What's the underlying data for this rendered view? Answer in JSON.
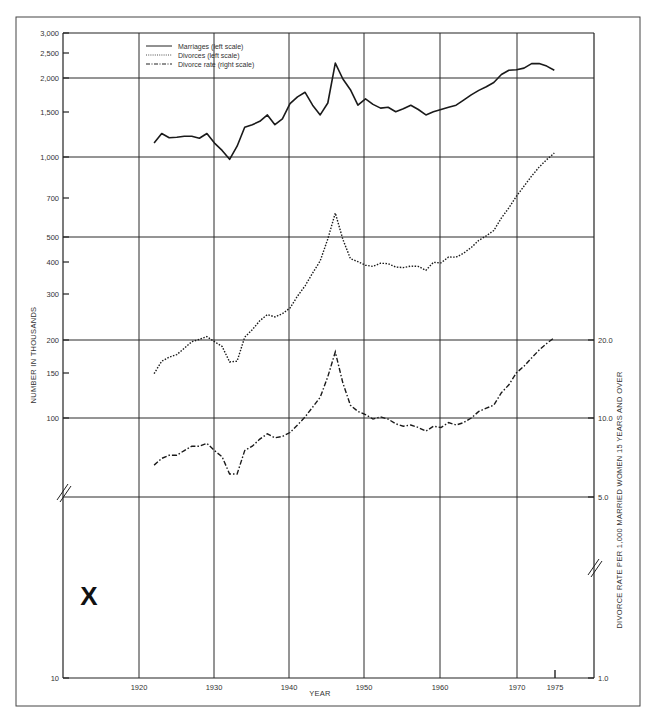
{
  "chart_data": {
    "type": "line",
    "title": "",
    "xlabel": "YEAR",
    "ylabel_left": "NUMBER IN THOUSANDS",
    "ylabel_right": "DIVORCE RATE PER 1,000 MARRIED WOMEN 15 YEARS AND OVER",
    "x_ticks": [
      "1920",
      "1930",
      "1940",
      "1950",
      "1960",
      "1970",
      "1975"
    ],
    "x_range": [
      1911,
      1980
    ],
    "y_left_scale": "log",
    "y_left_ticks": [
      "3,000",
      "2,500",
      "2,000",
      "1,500",
      "1,000",
      "700",
      "500",
      "400",
      "300",
      "200",
      "150",
      "100",
      "10"
    ],
    "y_left_range": [
      10,
      3000
    ],
    "y_right_scale": "log",
    "y_right_ticks": [
      "20.0",
      "10.0",
      "5.0",
      "1.0"
    ],
    "y_right_range": [
      1.0,
      30.0
    ],
    "axis_breaks": "both vertical axes broken between ~50 and 10 (left) / 5.0 and 1.0 (right)",
    "grid": true,
    "legend_position": "top-left inside plot",
    "legend": [
      {
        "label": "Marriages (left scale)",
        "style": "solid"
      },
      {
        "label": "Divorces (left scale)",
        "style": "dotted"
      },
      {
        "label": "Divorce rate (right scale)",
        "style": "dash-dot"
      }
    ],
    "annotations": [
      "X"
    ],
    "x": [
      1922,
      1923,
      1924,
      1925,
      1926,
      1927,
      1928,
      1929,
      1930,
      1931,
      1932,
      1933,
      1934,
      1935,
      1936,
      1937,
      1938,
      1939,
      1940,
      1941,
      1942,
      1943,
      1944,
      1945,
      1946,
      1947,
      1948,
      1949,
      1950,
      1951,
      1952,
      1953,
      1954,
      1955,
      1956,
      1957,
      1958,
      1959,
      1960,
      1961,
      1962,
      1963,
      1964,
      1965,
      1966,
      1967,
      1968,
      1969,
      1970,
      1971,
      1972,
      1973,
      1974,
      1975
    ],
    "series": [
      {
        "name": "Marriages (left scale)",
        "axis": "left",
        "unit": "thousands",
        "values": [
          1130,
          1230,
          1185,
          1190,
          1200,
          1200,
          1180,
          1230,
          1130,
          1060,
          980,
          1100,
          1300,
          1330,
          1370,
          1450,
          1330,
          1400,
          1600,
          1700,
          1770,
          1580,
          1450,
          1610,
          2290,
          1990,
          1810,
          1580,
          1670,
          1590,
          1540,
          1550,
          1490,
          1530,
          1580,
          1520,
          1450,
          1490,
          1520,
          1550,
          1580,
          1650,
          1730,
          1800,
          1860,
          1930,
          2070,
          2150,
          2160,
          2190,
          2280,
          2280,
          2230,
          2150
        ]
      },
      {
        "name": "Divorces (left scale)",
        "axis": "left",
        "unit": "thousands",
        "values": [
          148,
          165,
          171,
          175,
          185,
          196,
          200,
          205,
          196,
          188,
          164,
          165,
          204,
          218,
          236,
          249,
          244,
          251,
          264,
          293,
          321,
          359,
          400,
          485,
          610,
          483,
          408,
          397,
          385,
          381,
          392,
          390,
          379,
          377,
          382,
          381,
          368,
          395,
          393,
          414,
          413,
          428,
          450,
          479,
          499,
          523,
          584,
          639,
          708,
          773,
          845,
          915,
          977,
          1036
        ]
      },
      {
        "name": "Divorce rate (right scale)",
        "axis": "right",
        "unit": "per 1,000 married women 15+",
        "values": [
          6.6,
          7.0,
          7.2,
          7.2,
          7.5,
          7.8,
          7.8,
          8.0,
          7.5,
          7.1,
          6.1,
          6.1,
          7.5,
          7.8,
          8.3,
          8.7,
          8.4,
          8.5,
          8.8,
          9.4,
          10.1,
          11.0,
          12.0,
          14.4,
          17.9,
          13.6,
          11.2,
          10.6,
          10.3,
          9.9,
          10.1,
          9.9,
          9.5,
          9.3,
          9.4,
          9.2,
          8.9,
          9.3,
          9.2,
          9.6,
          9.4,
          9.6,
          10.0,
          10.6,
          10.9,
          11.2,
          12.5,
          13.4,
          14.9,
          15.8,
          17.0,
          18.2,
          19.3,
          20.3
        ]
      }
    ]
  },
  "labels": {
    "xlabel": "YEAR",
    "ylabel_left": "NUMBER IN THOUSANDS",
    "ylabel_right": "DIVORCE RATE PER 1,000 MARRIED WOMEN 15 YEARS AND OVER",
    "legend_marriages": "Marriages (left scale)",
    "legend_divorces": "Divorces (left scale)",
    "legend_rate": "Divorce rate (right scale)",
    "annotation_x": "X",
    "left_ticks": [
      {
        "label": "3,000",
        "y": 33
      },
      {
        "label": "2,500",
        "y": 53
      },
      {
        "label": "2,000",
        "y": 78
      },
      {
        "label": "1,500",
        "y": 112
      },
      {
        "label": "1,000",
        "y": 157
      },
      {
        "label": "700",
        "y": 198
      },
      {
        "label": "500",
        "y": 237
      },
      {
        "label": "400",
        "y": 262
      },
      {
        "label": "300",
        "y": 294
      },
      {
        "label": "200",
        "y": 340
      },
      {
        "label": "150",
        "y": 373
      },
      {
        "label": "100",
        "y": 418
      },
      {
        "label": "10",
        "y": 678
      }
    ],
    "right_ticks": [
      {
        "label": "20.0",
        "y": 340
      },
      {
        "label": "10.0",
        "y": 418
      },
      {
        "label": "5.0",
        "y": 497
      },
      {
        "label": "1.0",
        "y": 678
      }
    ],
    "x_ticks": [
      {
        "label": "1920",
        "x": 139
      },
      {
        "label": "1930",
        "x": 214
      },
      {
        "label": "1940",
        "x": 289
      },
      {
        "label": "1950",
        "x": 364
      },
      {
        "label": "1960",
        "x": 440
      },
      {
        "label": "1970",
        "x": 517
      },
      {
        "label": "1975",
        "x": 555
      }
    ]
  },
  "colors": {
    "line": "#1a1a1a",
    "grid": "#2a2a2a",
    "background": "#ffffff",
    "text": "#333333"
  }
}
